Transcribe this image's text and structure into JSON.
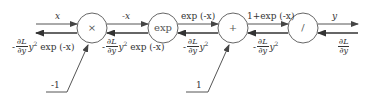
{
  "diagram": {
    "type": "computational-graph",
    "nodes": [
      {
        "id": "mul",
        "label": "×"
      },
      {
        "id": "exp",
        "label": "exp"
      },
      {
        "id": "add",
        "label": "+"
      },
      {
        "id": "div",
        "label": "/"
      }
    ],
    "forward_labels": {
      "input_x": "x",
      "neg_x": "-x",
      "exp_neg_x": "exp (-x)",
      "one_plus_exp": "1+exp (-x)",
      "output_y": "y"
    },
    "backward_labels": {
      "grad_x": {
        "minus": "-",
        "num": "∂L",
        "den": "∂y",
        "rest_pre": "y",
        "rest_sup": "2",
        "rest_post": "exp (-x)"
      },
      "grad_neg_x": {
        "minus": "-",
        "num": "∂L",
        "den": "∂y",
        "rest_pre": "y",
        "rest_sup": "2",
        "rest_post": "exp (-x)"
      },
      "grad_exp": {
        "minus": "-",
        "num": "∂L",
        "den": "∂y",
        "rest_pre": "y",
        "rest_sup": "2",
        "rest_post": ""
      },
      "grad_sum": {
        "minus": "-",
        "num": "∂L",
        "den": "∂y",
        "rest_pre": "y",
        "rest_sup": "2",
        "rest_post": ""
      },
      "grad_y": {
        "minus": "",
        "num": "∂L",
        "den": "∂y",
        "rest_pre": "",
        "rest_sup": "",
        "rest_post": ""
      }
    },
    "constants": {
      "neg_one": "-1",
      "one": "1"
    },
    "colors": {
      "line": "#555555",
      "text": "#333333"
    }
  }
}
